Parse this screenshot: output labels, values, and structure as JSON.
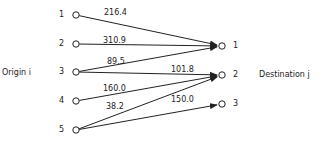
{
  "diagram": {
    "origin_label": "Origin i",
    "destination_label": "Destination j",
    "origins": [
      {
        "id": "1",
        "x": 76,
        "y": 15
      },
      {
        "id": "2",
        "x": 76,
        "y": 44
      },
      {
        "id": "3",
        "x": 76,
        "y": 72
      },
      {
        "id": "4",
        "x": 76,
        "y": 101
      },
      {
        "id": "5",
        "x": 76,
        "y": 130
      }
    ],
    "destinations": [
      {
        "id": "1",
        "x": 222,
        "y": 46
      },
      {
        "id": "2",
        "x": 222,
        "y": 75
      },
      {
        "id": "3",
        "x": 222,
        "y": 104
      }
    ],
    "edges": [
      {
        "from": "1",
        "to": "1",
        "value": "216.4",
        "lx": 104,
        "ly": 9
      },
      {
        "from": "2",
        "to": "1",
        "value": "310.9",
        "lx": 103,
        "ly": 37
      },
      {
        "from": "3",
        "to": "1",
        "value": "89.5",
        "lx": 107,
        "ly": 58
      },
      {
        "from": "3",
        "to": "2",
        "value": "101.8",
        "lx": 171,
        "ly": 66
      },
      {
        "from": "4",
        "to": "2",
        "value": "160.0",
        "lx": 103,
        "ly": 85
      },
      {
        "from": "5",
        "to": "2",
        "value": "38.2",
        "lx": 106,
        "ly": 103
      },
      {
        "from": "5",
        "to": "3",
        "value": "150.0",
        "lx": 171,
        "ly": 96
      }
    ]
  }
}
